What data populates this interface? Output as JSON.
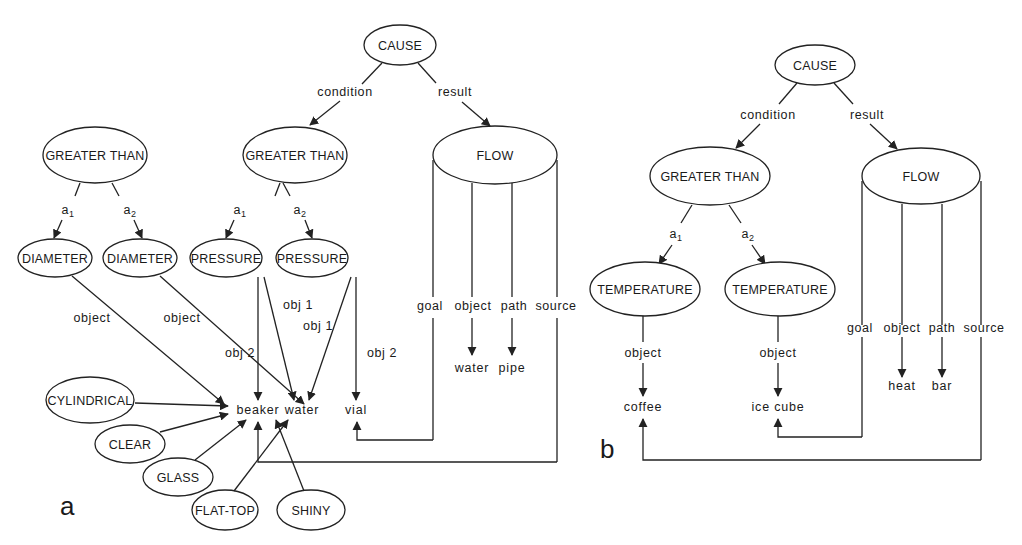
{
  "figure": {
    "panels": [
      {
        "label": "a",
        "nodes": {
          "cause": "CAUSE",
          "greater_than_left": "GREATER THAN",
          "greater_than_mid": "GREATER THAN",
          "flow": "FLOW",
          "diameter_1": "DIAMETER",
          "diameter_2": "DIAMETER",
          "pressure_1": "PRESSURE",
          "pressure_2": "PRESSURE",
          "cylindrical": "CYLINDRICAL",
          "clear": "CLEAR",
          "glass": "GLASS",
          "flat_top": "FLAT-TOP",
          "shiny": "SHINY"
        },
        "edge_labels": {
          "condition": "condition",
          "result": "result",
          "a1_left": "a",
          "a2_left": "a",
          "a1_mid": "a",
          "a2_mid": "a",
          "sub1": "1",
          "sub2": "2",
          "object_1": "object",
          "object_2": "object",
          "obj1_a": "obj 1",
          "obj1_b": "obj 1",
          "obj2_a": "obj 2",
          "obj2_b": "obj 2",
          "goal": "goal",
          "object_flow": "object",
          "path": "path",
          "source": "source"
        },
        "entities": {
          "beaker": "beaker",
          "water": "water",
          "vial": "vial",
          "water_flow": "water",
          "pipe": "pipe"
        }
      },
      {
        "label": "b",
        "nodes": {
          "cause": "CAUSE",
          "greater_than": "GREATER THAN",
          "flow": "FLOW",
          "temperature_1": "TEMPERATURE",
          "temperature_2": "TEMPERATURE"
        },
        "edge_labels": {
          "condition": "condition",
          "result": "result",
          "a1": "a",
          "a2": "a",
          "sub1": "1",
          "sub2": "2",
          "object_1": "object",
          "object_2": "object",
          "goal": "goal",
          "object_flow": "object",
          "path": "path",
          "source": "source"
        },
        "entities": {
          "coffee": "coffee",
          "ice_cube": "ice cube",
          "heat": "heat",
          "bar": "bar"
        }
      }
    ]
  }
}
